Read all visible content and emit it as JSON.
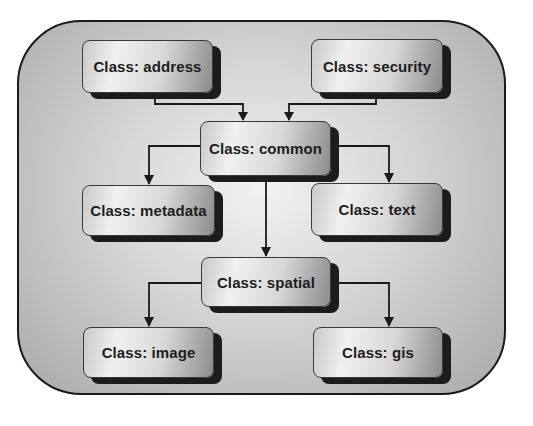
{
  "diagram": {
    "type": "class-hierarchy",
    "nodes": {
      "address": {
        "label": "Class: address"
      },
      "security": {
        "label": "Class: security"
      },
      "common": {
        "label": "Class: common"
      },
      "metadata": {
        "label": "Class: metadata"
      },
      "text": {
        "label": "Class: text"
      },
      "spatial": {
        "label": "Class: spatial"
      },
      "image": {
        "label": "Class: image"
      },
      "gis": {
        "label": "Class: gis"
      }
    },
    "edges": [
      {
        "from": "address",
        "to": "common"
      },
      {
        "from": "security",
        "to": "common"
      },
      {
        "from": "common",
        "to": "metadata"
      },
      {
        "from": "common",
        "to": "text"
      },
      {
        "from": "common",
        "to": "spatial"
      },
      {
        "from": "spatial",
        "to": "image"
      },
      {
        "from": "spatial",
        "to": "gis"
      }
    ],
    "colors": {
      "border": "#1a1a1a",
      "shadow": "#1c1c1c",
      "text": "#1d1d1d",
      "background_center": "#f2f2f2",
      "background_edge": "#a9a9a9"
    }
  }
}
